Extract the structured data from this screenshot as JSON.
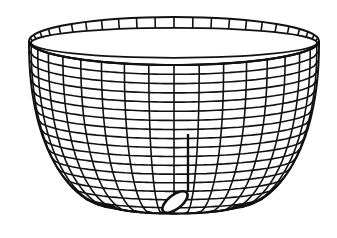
{
  "figure": {
    "description": "Line drawing of a wire-mesh bowl with a musical note inside",
    "background": "#ffffff",
    "stroke_color": "#111111",
    "bowl": {
      "label": "mesh bowl",
      "rim_center_x": 174,
      "rim_center_y": 41,
      "rim_rx": 145,
      "rim_ry_outer": 24,
      "rim_band_height": 9,
      "bottom_y": 230,
      "vertical_wires": 18,
      "horizontal_rings": 17
    },
    "note": {
      "label": "musical note",
      "stem_x": 188,
      "stem_top_y": 134,
      "stem_bottom_y": 192,
      "head_cx": 175,
      "head_cy": 202,
      "head_rx": 15,
      "head_ry": 7,
      "head_rotation_deg": -38
    }
  }
}
